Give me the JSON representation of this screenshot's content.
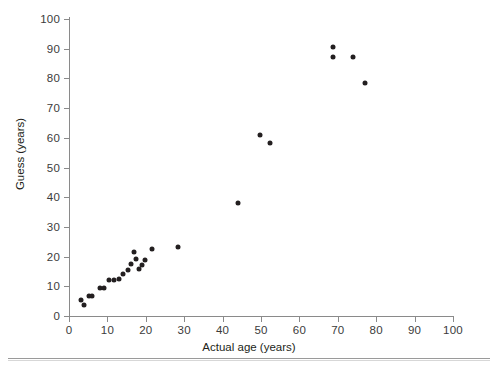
{
  "chart_data": {
    "type": "scatter",
    "title": "",
    "xlabel": "Actual age (years)",
    "ylabel": "Guess (years)",
    "xlim": [
      0,
      100
    ],
    "ylim": [
      0,
      100
    ],
    "xticks": [
      0,
      10,
      20,
      30,
      40,
      50,
      60,
      70,
      80,
      90,
      100
    ],
    "yticks": [
      0,
      10,
      20,
      30,
      40,
      50,
      60,
      70,
      80,
      90,
      100
    ],
    "grid": false,
    "legend": null,
    "marker": {
      "shape": "circle",
      "color": "#231f20",
      "size": 5
    },
    "series": [
      {
        "name": "Age guesses",
        "points": [
          {
            "x": 3.1,
            "y": 5.4
          },
          {
            "x": 3.9,
            "y": 3.7
          },
          {
            "x": 5.2,
            "y": 6.7
          },
          {
            "x": 6.0,
            "y": 6.7
          },
          {
            "x": 8.1,
            "y": 9.4
          },
          {
            "x": 9.1,
            "y": 9.4
          },
          {
            "x": 10.4,
            "y": 12.1
          },
          {
            "x": 11.7,
            "y": 12.1
          },
          {
            "x": 13.0,
            "y": 12.5
          },
          {
            "x": 14.1,
            "y": 14.1
          },
          {
            "x": 15.4,
            "y": 15.5
          },
          {
            "x": 16.1,
            "y": 17.5
          },
          {
            "x": 16.9,
            "y": 21.5
          },
          {
            "x": 17.5,
            "y": 19.2
          },
          {
            "x": 18.2,
            "y": 15.8
          },
          {
            "x": 19.0,
            "y": 17.2
          },
          {
            "x": 19.8,
            "y": 18.9
          },
          {
            "x": 21.6,
            "y": 22.6
          },
          {
            "x": 28.4,
            "y": 23.2
          },
          {
            "x": 44.0,
            "y": 38.0
          },
          {
            "x": 49.7,
            "y": 61.0
          },
          {
            "x": 52.3,
            "y": 58.4
          },
          {
            "x": 68.8,
            "y": 90.6
          },
          {
            "x": 68.8,
            "y": 87.3
          },
          {
            "x": 73.9,
            "y": 87.3
          },
          {
            "x": 77.2,
            "y": 78.5
          }
        ]
      }
    ]
  },
  "axis": {
    "x_title": "Actual age (years)",
    "y_title": "Guess (years)"
  }
}
